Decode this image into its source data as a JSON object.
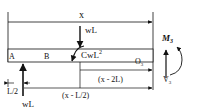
{
  "diagram": {
    "type": "beam free-body diagram",
    "labels": {
      "x_dim": "x",
      "load_top": "wL",
      "moment_applied": "CwL",
      "moment_exp": "2",
      "point_a": "A",
      "point_b": "B",
      "point_o": "O",
      "point_o_sub": "3",
      "moment_section": "M",
      "moment_section_sub": "3",
      "shear_section": "V",
      "shear_section_sub": "3",
      "dim_x_minus_2L": "(x - 2L)",
      "dim_x_minus_L2": "(x - L/2)",
      "dim_L2": "L/2",
      "reaction": "wL"
    },
    "colors": {
      "line": "#111111",
      "beam_fill": "#ffffff",
      "background": "#ffffff"
    }
  }
}
